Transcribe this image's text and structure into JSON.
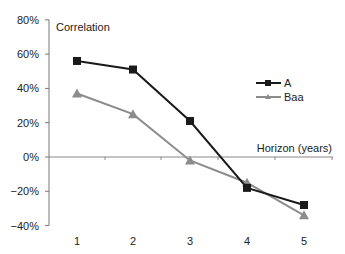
{
  "chart_data": {
    "type": "line",
    "title": "",
    "ylabel": "Correlation",
    "xlabel": "Horizon (years)",
    "categories": [
      "1",
      "2",
      "3",
      "4",
      "5"
    ],
    "ylim": [
      -0.4,
      0.8
    ],
    "yticks": [
      "80%",
      "60%",
      "40%",
      "20%",
      "0%",
      "−20%",
      "−40%"
    ],
    "ytick_values": [
      0.8,
      0.6,
      0.4,
      0.2,
      0.0,
      -0.2,
      -0.4
    ],
    "grid": false,
    "legend_position": "right",
    "series": [
      {
        "name": "A",
        "marker": "square",
        "color": "#1a1a1a",
        "values": [
          0.56,
          0.51,
          0.21,
          -0.18,
          -0.28
        ]
      },
      {
        "name": "Baa",
        "marker": "triangle",
        "color": "#8c8c8c",
        "values": [
          0.37,
          0.25,
          -0.02,
          -0.15,
          -0.34
        ]
      }
    ]
  }
}
